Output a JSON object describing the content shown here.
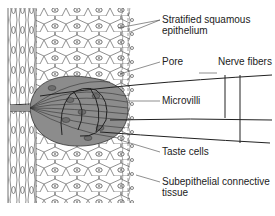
{
  "figure": {
    "colors": {
      "taste_bud_fill": "#8c8c8c",
      "tissue_line": "#333333",
      "label_text": "#222222",
      "background": "#ffffff"
    },
    "labels": [
      {
        "id": "stratified",
        "line1": "Stratified squamous",
        "line2": "epithelium"
      },
      {
        "id": "pore",
        "line1": "Pore"
      },
      {
        "id": "nerve",
        "line1": "Nerve fibers"
      },
      {
        "id": "microvilli",
        "line1": "Microvilli"
      },
      {
        "id": "taste_cells",
        "line1": "Taste cells"
      },
      {
        "id": "subepithelial",
        "line1": "Subepithelial connective",
        "line2": "tissue"
      }
    ]
  }
}
